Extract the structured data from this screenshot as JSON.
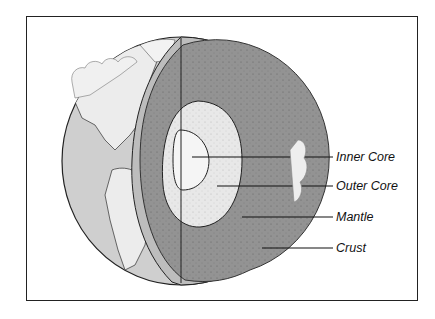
{
  "diagram": {
    "colors": {
      "background": "#ffffff",
      "frame": "#222222",
      "ocean_surface": "#c9c9c9",
      "land_surface": "#e4e4e4",
      "crust": "#b8b8b8",
      "mantle": "#8f8f8f",
      "outer_core": "#e6e6e6",
      "inner_core": "#f4f4f4",
      "leader_lines": "#111111"
    },
    "labels": [
      {
        "id": "inner-core",
        "text": "Inner Core"
      },
      {
        "id": "outer-core",
        "text": "Outer Core"
      },
      {
        "id": "mantle",
        "text": "Mantle"
      },
      {
        "id": "crust",
        "text": "Crust"
      }
    ]
  }
}
